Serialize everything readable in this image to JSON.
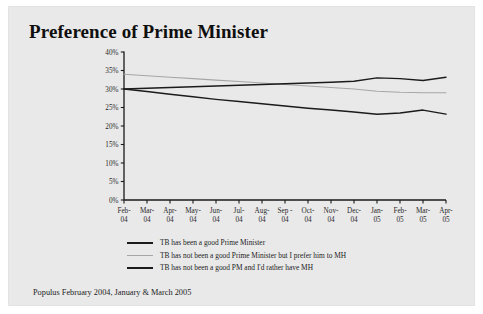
{
  "panel": {
    "background_color": "#e9e9e9",
    "page_background_color": "#ffffff"
  },
  "title": "Preference of Prime Minister",
  "footer": "Populus February 2004, January & March 2005",
  "legend": {
    "position": "below-plot",
    "entries": [
      {
        "label": "TB has been a good Prime Minister",
        "swatch": "dark",
        "color": "#1b1b1b"
      },
      {
        "label": "TB has not been a good Prime Minister but I prefer him to MH",
        "swatch": "gray",
        "color": "#a6a6a6"
      },
      {
        "label": "TB has not been a good PM and I'd rather have MH",
        "swatch": "dark",
        "color": "#1b1b1b"
      }
    ]
  },
  "chart_data": {
    "type": "line",
    "title": "Preference of Prime Minister",
    "xlabel": "",
    "ylabel": "",
    "ylim": [
      0,
      40
    ],
    "yticks": [
      0,
      5,
      10,
      15,
      20,
      25,
      30,
      35,
      40
    ],
    "ytick_labels": [
      "0%",
      "5%",
      "10%",
      "15%",
      "20%",
      "25%",
      "30%",
      "35%",
      "40%"
    ],
    "grid": false,
    "legend_position": "below",
    "categories": [
      "Feb-\n04",
      "Mar-\n04",
      "Apr-\n04",
      "May-\n04",
      "Jun-\n04",
      "Jul-\n04",
      "Aug-\n04",
      "Sep -\n04",
      "Oct-\n04",
      "Nov-\n04",
      "Dec-\n04",
      "Jan-\n05",
      "Feb-\n05",
      "Mar-\n05",
      "Apr-\n05"
    ],
    "category_labels_top": [
      "Feb-",
      "Mar-",
      "Apr-",
      "May-",
      "Jun-",
      "Jul-",
      "Aug-",
      "Sep -",
      "Oct-",
      "Nov-",
      "Dec-",
      "Jan-",
      "Feb-",
      "Mar-",
      "Apr-"
    ],
    "category_labels_bottom": [
      "04",
      "04",
      "04",
      "04",
      "04",
      "04",
      "04",
      "04",
      "04",
      "04",
      "04",
      "05",
      "05",
      "05",
      "05"
    ],
    "series": [
      {
        "name": "TB has been a good Prime Minister",
        "color": "#1b1b1b",
        "style": "thick",
        "values": [
          30.0,
          30.2,
          30.4,
          30.6,
          30.8,
          31.0,
          31.2,
          31.4,
          31.6,
          31.8,
          32.1,
          33.0,
          32.8,
          32.3,
          33.2
        ]
      },
      {
        "name": "TB has not been a good Prime Minister but I prefer him to MH",
        "color": "#a6a6a6",
        "style": "thin",
        "values": [
          34.0,
          33.6,
          33.2,
          32.8,
          32.4,
          32.0,
          31.6,
          31.2,
          30.8,
          30.4,
          30.0,
          29.4,
          29.1,
          29.0,
          29.0
        ]
      },
      {
        "name": "TB has not been a good PM and I'd rather have MH",
        "color": "#1b1b1b",
        "style": "thick",
        "values": [
          30.0,
          29.3,
          28.6,
          27.9,
          27.2,
          26.6,
          26.0,
          25.4,
          24.8,
          24.3,
          23.8,
          23.2,
          23.5,
          24.3,
          23.2
        ]
      }
    ]
  }
}
